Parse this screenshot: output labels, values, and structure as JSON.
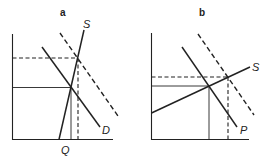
{
  "panels": [
    {
      "id": "a",
      "label": "a",
      "curves": [
        {
          "name": "supply",
          "label": "S",
          "style": "solid"
        },
        {
          "name": "demand",
          "label": "D",
          "style": "solid"
        },
        {
          "name": "shifted-demand",
          "label": "",
          "style": "dashed"
        }
      ],
      "axis_labels": {
        "x_marker": "Q"
      }
    },
    {
      "id": "b",
      "label": "b",
      "curves": [
        {
          "name": "supply",
          "label": "S",
          "style": "solid"
        },
        {
          "name": "demand",
          "label": "P",
          "style": "solid"
        },
        {
          "name": "shifted-demand",
          "label": "",
          "style": "dashed"
        }
      ],
      "axis_labels": {}
    }
  ],
  "colors": {
    "line": "#222222",
    "background": "#ffffff"
  }
}
